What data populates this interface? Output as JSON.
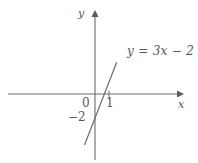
{
  "figure": {
    "background_color": "#ffffff",
    "ink_color": "#6b6b6b",
    "text_color": "#585858"
  },
  "labels": {
    "y_axis": "y",
    "x_axis": "x",
    "origin": "0",
    "tick_one": "1",
    "y_intercept": "−2",
    "equation": "y = 3x − 2"
  },
  "chart_data": {
    "type": "line",
    "title": "",
    "subtitle": "",
    "xlabel": "x",
    "ylabel": "y",
    "xlim": [
      -2.9,
      3.6
    ],
    "ylim": [
      -4.6,
      6.2
    ],
    "grid": false,
    "legend": null,
    "annotations": [
      {
        "text": "y = 3x − 2",
        "x": 1.3,
        "y": 3.5
      }
    ],
    "xticks": [
      0,
      1
    ],
    "xtick_labels": [
      "0",
      "1"
    ],
    "yticks": [
      -2
    ],
    "ytick_labels": [
      "−2"
    ],
    "series": [
      {
        "name": "y = 3x - 2",
        "equation": "y = 3x - 2",
        "slope": 3,
        "intercept": -2,
        "x_intercept": 0.6667,
        "y_intercept": -2,
        "x": [
          -0.75,
          1.55
        ],
        "values": [
          -4.25,
          2.65
        ],
        "color": "#6b6b6b"
      }
    ],
    "axes": {
      "x_axis_arrow": true,
      "y_axis_arrow": true,
      "x_axis_from": -2.9,
      "x_axis_to": 3.5,
      "y_axis_from": -4.4,
      "y_axis_to": 6.0
    }
  }
}
